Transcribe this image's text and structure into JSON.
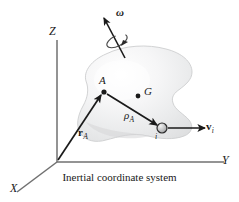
{
  "figure": {
    "caption": "Inertial coordinate system",
    "colors": {
      "ink": "#1a1a1a",
      "axis": "#6b6b6b",
      "body_fill_light": "#fdfdfd",
      "body_fill_mid": "#ececed",
      "body_fill_dark": "#d9dadb",
      "body_outline": "#c9cacb",
      "particle_fill": "#b9babb",
      "particle_edge": "#2a2a2a"
    },
    "axes": [
      {
        "name": "z-axis",
        "label": "Z"
      },
      {
        "name": "y-axis",
        "label": "Y"
      },
      {
        "name": "x-axis",
        "label": "X"
      }
    ],
    "points": [
      {
        "name": "point-a",
        "label": "A"
      },
      {
        "name": "point-g",
        "label": "G"
      },
      {
        "name": "particle-i",
        "label": "i"
      }
    ],
    "vectors": [
      {
        "name": "position-vector-ra",
        "label": "r",
        "subscript": "A"
      },
      {
        "name": "relative-position-vector-rho-a",
        "label": "ρ",
        "subscript": "A"
      },
      {
        "name": "velocity-vector-vi",
        "label": "v",
        "subscript": "i"
      },
      {
        "name": "angular-velocity-omega",
        "label": "ω",
        "subscript": ""
      }
    ],
    "labels": {
      "z": "Z",
      "y": "Y",
      "x": "X",
      "a": "A",
      "g": "G",
      "i": "i",
      "omega": "ω",
      "rho": "ρ",
      "rho_sub": "A",
      "r_vec": "r",
      "r_sub": "A",
      "v_vec": "v",
      "v_sub": "i"
    }
  }
}
